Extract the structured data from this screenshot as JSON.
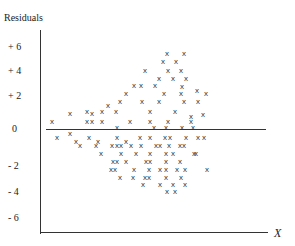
{
  "chart_data": {
    "type": "scatter",
    "title": "",
    "ylabel": "Residuals",
    "xlabel": "X",
    "ytick_labels": [
      "+ 6",
      "+ 4",
      "+ 2",
      "0",
      "- 2",
      "- 4",
      "- 6"
    ],
    "ylim": [
      -7,
      7
    ],
    "grid": false,
    "marker": "x",
    "reference_line": {
      "y": 0,
      "label": "0"
    },
    "pattern": "funnel: residual spread increases with X (heteroscedasticity)",
    "points_px": [
      [
        52,
        123
      ],
      [
        70,
        115
      ],
      [
        87,
        113
      ],
      [
        87,
        123
      ],
      [
        102,
        123
      ],
      [
        116,
        113
      ],
      [
        130,
        123
      ],
      [
        142,
        103
      ],
      [
        150,
        113
      ],
      [
        159,
        103
      ],
      [
        150,
        123
      ],
      [
        168,
        123
      ],
      [
        175,
        113
      ],
      [
        164,
        95
      ],
      [
        181,
        95
      ],
      [
        184,
        103
      ],
      [
        198,
        103
      ],
      [
        206,
        95
      ],
      [
        70,
        135
      ],
      [
        57,
        139
      ],
      [
        76,
        143
      ],
      [
        89,
        139
      ],
      [
        98,
        143
      ],
      [
        117,
        139
      ],
      [
        126,
        143
      ],
      [
        140,
        139
      ],
      [
        150,
        139
      ],
      [
        165,
        139
      ],
      [
        170,
        139
      ],
      [
        186,
        139
      ],
      [
        198,
        139
      ],
      [
        204,
        139
      ],
      [
        80,
        147
      ],
      [
        96,
        147
      ],
      [
        112,
        147
      ],
      [
        117,
        147
      ],
      [
        121,
        147
      ],
      [
        131,
        147
      ],
      [
        141,
        147
      ],
      [
        156,
        147
      ],
      [
        160,
        147
      ],
      [
        169,
        147
      ],
      [
        180,
        147
      ],
      [
        184,
        147
      ],
      [
        101,
        155
      ],
      [
        121,
        155
      ],
      [
        136,
        155
      ],
      [
        150,
        155
      ],
      [
        166,
        155
      ],
      [
        173,
        155
      ],
      [
        194,
        155
      ],
      [
        196,
        155
      ],
      [
        113,
        163
      ],
      [
        117,
        163
      ],
      [
        126,
        163
      ],
      [
        146,
        163
      ],
      [
        150,
        163
      ],
      [
        166,
        163
      ],
      [
        180,
        163
      ],
      [
        111,
        171
      ],
      [
        115,
        171
      ],
      [
        134,
        171
      ],
      [
        149,
        171
      ],
      [
        160,
        171
      ],
      [
        166,
        171
      ],
      [
        177,
        171
      ],
      [
        185,
        171
      ],
      [
        207,
        171
      ],
      [
        120,
        179
      ],
      [
        133,
        179
      ],
      [
        145,
        179
      ],
      [
        149,
        179
      ],
      [
        166,
        179
      ],
      [
        181,
        179
      ],
      [
        143,
        186
      ],
      [
        160,
        186
      ],
      [
        173,
        186
      ],
      [
        185,
        186
      ],
      [
        167,
        193
      ],
      [
        175,
        193
      ],
      [
        92,
        115
      ],
      [
        92,
        123
      ],
      [
        102,
        113
      ],
      [
        108,
        107
      ],
      [
        120,
        103
      ],
      [
        126,
        95
      ],
      [
        134,
        87
      ],
      [
        141,
        87
      ],
      [
        155,
        87
      ],
      [
        159,
        80
      ],
      [
        168,
        72
      ],
      [
        181,
        72
      ],
      [
        186,
        80
      ],
      [
        173,
        80
      ],
      [
        145,
        72
      ],
      [
        163,
        63
      ],
      [
        176,
        63
      ],
      [
        167,
        55
      ],
      [
        184,
        55
      ],
      [
        182,
        88
      ],
      [
        197,
        92
      ],
      [
        191,
        118
      ],
      [
        191,
        123
      ],
      [
        203,
        116
      ],
      [
        117,
        129
      ],
      [
        154,
        129
      ],
      [
        166,
        129
      ],
      [
        182,
        129
      ],
      [
        193,
        129
      ]
    ]
  }
}
